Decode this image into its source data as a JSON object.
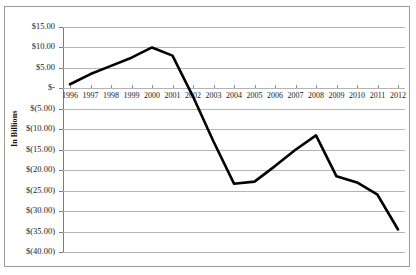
{
  "title": {
    "text": ""
  },
  "axis": {
    "y_title": "In Billions",
    "y_labels": [
      "$15.00",
      "$10.00",
      "$5.00",
      "$-",
      "$(5.00)",
      "$(10.00)",
      "$(15.00)",
      "$(20.00)",
      "$(25.00)",
      "$(30.00)",
      "$(35.00)",
      "$(40.00)"
    ]
  },
  "colors": {
    "line": "#000000",
    "gridline": "#b4b4b4",
    "axis": "#7a7a7a",
    "border": "#9a9a9a",
    "background": "#ffffff",
    "text": "#1a1a1a"
  },
  "chart_data": {
    "type": "line",
    "title": "",
    "xlabel": "",
    "ylabel": "In Billions",
    "categories": [
      "1996",
      "1997",
      "1998",
      "1999",
      "2000",
      "2001",
      "2002",
      "2003",
      "2004",
      "2005",
      "2006",
      "2007",
      "2008",
      "2009",
      "2010",
      "2011",
      "2012"
    ],
    "values": [
      1.0,
      3.5,
      5.5,
      7.5,
      10.0,
      8.0,
      -2.0,
      -13.0,
      -23.3,
      -22.8,
      -19.0,
      -15.0,
      -11.5,
      -21.5,
      -23.0,
      -26.0,
      -34.5
    ],
    "ylim": [
      -40,
      15
    ],
    "ytick_interval": 5,
    "grid": true,
    "legend": false,
    "series": [
      {
        "name": "",
        "values": [
          1.0,
          3.5,
          5.5,
          7.5,
          10.0,
          8.0,
          -2.0,
          -13.0,
          -23.3,
          -22.8,
          -19.0,
          -15.0,
          -11.5,
          -21.5,
          -23.0,
          -26.0,
          -34.5
        ]
      }
    ]
  }
}
